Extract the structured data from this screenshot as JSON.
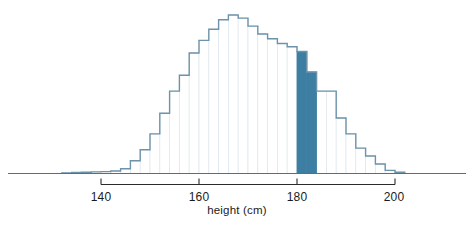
{
  "chart_data": {
    "type": "bar",
    "title": "",
    "subtitle": "",
    "xlabel": "height (cm)",
    "ylabel": "",
    "grid": false,
    "legend": null,
    "xlim": [
      131,
      206
    ],
    "ylim": [
      0,
      1.0
    ],
    "bin_width": 2,
    "axis_ticks": [
      {
        "value": 140,
        "label": "140"
      },
      {
        "value": 160,
        "label": "160"
      },
      {
        "value": 180,
        "label": "180"
      },
      {
        "value": 200,
        "label": "200"
      }
    ],
    "axis_range_drawn": [
      140,
      200
    ],
    "highlight_range": [
      180,
      184
    ],
    "highlight_note": "bars from 180 cm to 184 cm filled solid dark blue",
    "categories": [
      "132-134",
      "134-136",
      "136-138",
      "138-140",
      "140-142",
      "142-144",
      "144-146",
      "146-148",
      "148-150",
      "150-152",
      "152-154",
      "154-156",
      "156-158",
      "158-160",
      "160-162",
      "162-164",
      "164-166",
      "166-168",
      "168-170",
      "170-172",
      "172-174",
      "174-176",
      "176-178",
      "178-180",
      "180-182",
      "182-184",
      "184-186",
      "186-188",
      "188-190",
      "190-192",
      "192-194",
      "194-196",
      "196-198",
      "198-200",
      "200-202"
    ],
    "bin_starts": [
      132,
      134,
      136,
      138,
      140,
      142,
      144,
      146,
      148,
      150,
      152,
      154,
      156,
      158,
      160,
      162,
      164,
      166,
      168,
      170,
      172,
      174,
      176,
      178,
      180,
      182,
      184,
      186,
      188,
      190,
      192,
      194,
      196,
      198,
      200
    ],
    "values": [
      0.004,
      0.006,
      0.008,
      0.01,
      0.012,
      0.016,
      0.03,
      0.08,
      0.15,
      0.25,
      0.38,
      0.52,
      0.62,
      0.76,
      0.84,
      0.91,
      0.97,
      1.0,
      0.98,
      0.93,
      0.88,
      0.85,
      0.82,
      0.8,
      0.77,
      0.64,
      0.52,
      0.52,
      0.35,
      0.25,
      0.16,
      0.11,
      0.06,
      0.02,
      0.008
    ],
    "highlighted_bins": [
      {
        "range": "180-182",
        "value": 0.77
      },
      {
        "range": "182-184",
        "value": 0.64
      }
    ],
    "colors": {
      "bar_outline": "#6d93ab",
      "bar_fill": "#ffffff",
      "highlight_fill": "#3d7fa3",
      "highlight_outline": "#3d7fa3",
      "baseline": "#6b6b63",
      "axis_line": "#2b2b2b",
      "text": "#1b1b1b",
      "background": "#ffffff"
    }
  },
  "labels": {
    "xlabel": "height (cm)",
    "tick_140": "140",
    "tick_160": "160",
    "tick_180": "180",
    "tick_200": "200"
  }
}
